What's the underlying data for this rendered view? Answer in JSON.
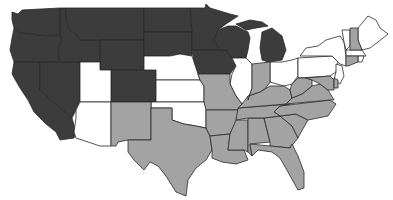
{
  "map": {
    "title": "",
    "region": "Contiguous United States",
    "categories": {
      "dark": {
        "color": "#3c3c3c"
      },
      "gray": {
        "color": "#a3a3a3"
      },
      "white": {
        "color": "#ffffff"
      }
    },
    "states": [
      {
        "id": "WA",
        "category": "dark"
      },
      {
        "id": "OR",
        "category": "dark"
      },
      {
        "id": "CA",
        "category": "dark"
      },
      {
        "id": "NV",
        "category": "dark"
      },
      {
        "id": "ID",
        "category": "dark"
      },
      {
        "id": "MT",
        "category": "dark"
      },
      {
        "id": "WY",
        "category": "dark"
      },
      {
        "id": "CO",
        "category": "dark"
      },
      {
        "id": "ND",
        "category": "dark"
      },
      {
        "id": "SD",
        "category": "dark"
      },
      {
        "id": "MN",
        "category": "dark"
      },
      {
        "id": "IA",
        "category": "dark"
      },
      {
        "id": "WI",
        "category": "dark"
      },
      {
        "id": "MI",
        "category": "dark"
      },
      {
        "id": "UT",
        "category": "white"
      },
      {
        "id": "AZ",
        "category": "white"
      },
      {
        "id": "NE",
        "category": "white"
      },
      {
        "id": "KS",
        "category": "white"
      },
      {
        "id": "OK",
        "category": "white"
      },
      {
        "id": "IL",
        "category": "white"
      },
      {
        "id": "OH",
        "category": "white"
      },
      {
        "id": "PA",
        "category": "white"
      },
      {
        "id": "NY",
        "category": "white"
      },
      {
        "id": "NJ",
        "category": "white"
      },
      {
        "id": "VT",
        "category": "white"
      },
      {
        "id": "ME",
        "category": "white"
      },
      {
        "id": "MA",
        "category": "white"
      },
      {
        "id": "RI",
        "category": "white"
      },
      {
        "id": "NM",
        "category": "gray"
      },
      {
        "id": "TX",
        "category": "gray"
      },
      {
        "id": "MO",
        "category": "gray"
      },
      {
        "id": "AR",
        "category": "gray"
      },
      {
        "id": "LA",
        "category": "gray"
      },
      {
        "id": "MS",
        "category": "gray"
      },
      {
        "id": "AL",
        "category": "gray"
      },
      {
        "id": "GA",
        "category": "gray"
      },
      {
        "id": "FL",
        "category": "gray"
      },
      {
        "id": "SC",
        "category": "gray"
      },
      {
        "id": "NC",
        "category": "gray"
      },
      {
        "id": "TN",
        "category": "gray"
      },
      {
        "id": "KY",
        "category": "gray"
      },
      {
        "id": "VA",
        "category": "gray"
      },
      {
        "id": "WV",
        "category": "gray"
      },
      {
        "id": "MD",
        "category": "gray"
      },
      {
        "id": "DE",
        "category": "gray"
      },
      {
        "id": "IN",
        "category": "gray"
      },
      {
        "id": "NH",
        "category": "gray"
      },
      {
        "id": "CT",
        "category": "gray"
      }
    ]
  }
}
